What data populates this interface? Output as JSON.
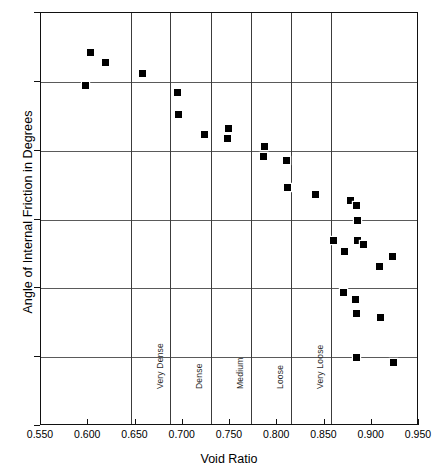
{
  "chart_data": {
    "type": "scatter",
    "title": "",
    "xlabel": "Void Ratio",
    "ylabel": "Angle of Internal Friction in Degrees",
    "xlim": [
      0.55,
      0.95
    ],
    "ylim": [
      15,
      45
    ],
    "grid": "horizontal",
    "legend": "none",
    "xticks": [
      "0.550",
      "0.600",
      "0.650",
      "0.700",
      "0.750",
      "0.800",
      "0.850",
      "0.900",
      "0.950"
    ],
    "xtick_values": [
      0.55,
      0.6,
      0.65,
      0.7,
      0.75,
      0.8,
      0.85,
      0.9,
      0.95
    ],
    "yticks": [
      "45",
      "40",
      "35",
      "30",
      "25",
      "20",
      "15"
    ],
    "ytick_values": [
      45,
      40,
      35,
      30,
      25,
      20,
      15
    ],
    "category_dividers": [
      0.645,
      0.687,
      0.73,
      0.772,
      0.815,
      0.857
    ],
    "category_labels": [
      {
        "label": "Very Dense",
        "x": 0.666,
        "y": 20
      },
      {
        "label": "Dense",
        "x": 0.708,
        "y": 20
      },
      {
        "label": "Medium",
        "x": 0.751,
        "y": 20
      },
      {
        "label": "Loose",
        "x": 0.793,
        "y": 20
      },
      {
        "label": "Very Loose",
        "x": 0.836,
        "y": 20
      }
    ],
    "series": [
      {
        "name": "Angle of internal friction vs void ratio",
        "marker": "square",
        "color": "#000000",
        "points": [
          {
            "x": 0.602,
            "y": 42.1
          },
          {
            "x": 0.618,
            "y": 41.4
          },
          {
            "x": 0.597,
            "y": 39.7
          },
          {
            "x": 0.657,
            "y": 40.6
          },
          {
            "x": 0.694,
            "y": 39.2
          },
          {
            "x": 0.695,
            "y": 37.6
          },
          {
            "x": 0.723,
            "y": 36.2
          },
          {
            "x": 0.748,
            "y": 36.6
          },
          {
            "x": 0.747,
            "y": 35.9
          },
          {
            "x": 0.786,
            "y": 35.3
          },
          {
            "x": 0.785,
            "y": 34.6
          },
          {
            "x": 0.81,
            "y": 34.3
          },
          {
            "x": 0.811,
            "y": 32.3
          },
          {
            "x": 0.84,
            "y": 31.8
          },
          {
            "x": 0.878,
            "y": 31.4
          },
          {
            "x": 0.884,
            "y": 31.0
          },
          {
            "x": 0.885,
            "y": 29.9
          },
          {
            "x": 0.86,
            "y": 28.5
          },
          {
            "x": 0.885,
            "y": 28.5
          },
          {
            "x": 0.891,
            "y": 28.2
          },
          {
            "x": 0.871,
            "y": 27.7
          },
          {
            "x": 0.922,
            "y": 27.3
          },
          {
            "x": 0.908,
            "y": 26.6
          },
          {
            "x": 0.87,
            "y": 24.7
          },
          {
            "x": 0.883,
            "y": 24.2
          },
          {
            "x": 0.884,
            "y": 23.2
          },
          {
            "x": 0.909,
            "y": 22.9
          },
          {
            "x": 0.884,
            "y": 20.0
          },
          {
            "x": 0.923,
            "y": 19.6
          }
        ]
      }
    ]
  }
}
